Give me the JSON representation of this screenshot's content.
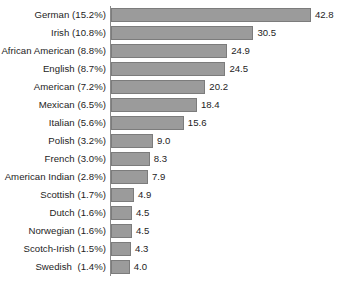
{
  "chart_data": {
    "type": "bar",
    "orientation": "horizontal",
    "title": "",
    "subtitle": "",
    "xlabel": "",
    "ylabel": "",
    "grid": false,
    "legend": false,
    "axis_tick_labels": [],
    "xlim": [
      0,
      42.8
    ],
    "value_precision": 1,
    "categories": [
      "German (15.2%)",
      "Irish (10.8%)",
      "African American (8.8%)",
      "English (8.7%)",
      "American (7.2%)",
      "Mexican (6.5%)",
      "Italian (5.6%)",
      "Polish (3.2%)",
      "French (3.0%)",
      "American Indian (2.8%)",
      "Scottish (1.7%)",
      "Dutch (1.6%)",
      "Norwegian (1.6%)",
      "Scotch-Irish (1.5%)",
      "Swedish  (1.4%)"
    ],
    "values": [
      42.8,
      30.5,
      24.9,
      24.5,
      20.2,
      18.4,
      15.6,
      9.0,
      8.3,
      7.9,
      4.9,
      4.5,
      4.5,
      4.3,
      4.0
    ],
    "value_labels": [
      "42.8",
      "30.5",
      "24.9",
      "24.5",
      "20.2",
      "18.4",
      "15.6",
      "9.0",
      "8.3",
      "7.9",
      "4.9",
      "4.5",
      "4.5",
      "4.3",
      "4.0"
    ],
    "group_names": [
      "German",
      "Irish",
      "African American",
      "English",
      "American",
      "Mexican",
      "Italian",
      "Polish",
      "French",
      "American Indian",
      "Scottish",
      "Dutch",
      "Norwegian",
      "Scotch-Irish",
      "Swedish"
    ],
    "group_percents": [
      "15.2%",
      "10.8%",
      "8.8%",
      "8.7%",
      "7.2%",
      "6.5%",
      "5.6%",
      "3.2%",
      "3.0%",
      "2.8%",
      "1.7%",
      "1.6%",
      "1.6%",
      "1.5%",
      "1.4%"
    ],
    "colors": {
      "bar_fill": "#9b9b9b",
      "bar_stroke": "#7c7c7c",
      "text": "#1d1d1d",
      "axis": "#8a8a8a",
      "background": "#ffffff"
    }
  },
  "layout": {
    "bar_origin_x": 111,
    "px_per_unit": 4.67,
    "row_pitch": 18,
    "bar_height": 14,
    "first_row_top": 6,
    "value_gap": 4
  }
}
